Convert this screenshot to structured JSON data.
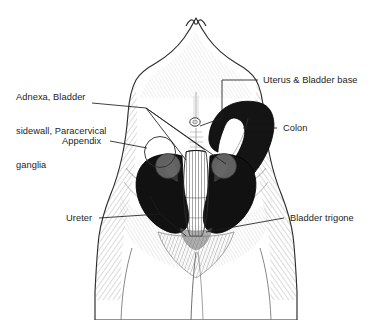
{
  "figure": {
    "background_color": "#ffffff",
    "ink_color": "#1d1d1d",
    "body_outline_color": "#2a2a2a",
    "organ_dark_color": "#111111",
    "organ_mid_color": "#4a4a4a",
    "organ_light_color": "#808080",
    "shading_color": "#9a9a9a"
  },
  "labels": {
    "adnexa": {
      "lines": [
        "Adnexa, Bladder",
        "sidewall, Paracervical",
        "ganglia"
      ],
      "line1": "Adnexa, Bladder",
      "line2": "sidewall, Paracervical",
      "line3": "ganglia"
    },
    "appendix": "Appendix",
    "ureter": "Ureter",
    "uterus_bladder_base": "Uterus & Bladder base",
    "colon": "Colon",
    "bladder_trigone": "Bladder trigone"
  },
  "structures": {
    "torso": "female-torso-front-view",
    "navel": "navel",
    "uterus_column": "uterus-and-bladder-base",
    "left_adnexa": "left-adnexal-mass",
    "right_adnexa": "right-adnexal-mass",
    "colon_shape": "sigmoid-colon",
    "appendix_circle": "appendix-marker-circle",
    "pubic_triangle": "pubic-region"
  }
}
